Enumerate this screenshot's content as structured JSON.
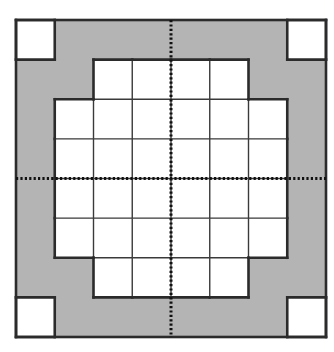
{
  "diagram": {
    "title": "",
    "grid": {
      "rows": 8,
      "cols": 8,
      "origin_x": 16,
      "origin_y": 20,
      "width": 310,
      "height": 317
    },
    "colors": {
      "background": "#ffffff",
      "shaded": "#b4b4b4",
      "cell_fill": "#ffffff",
      "grid_line": "#3a3a3a",
      "outline": "#2b2b2b",
      "dotted_line": "#111111"
    },
    "layout_map": [
      "WGGGGGGW",
      "GGWWWWGG",
      "GWWWWWWG",
      "GWWWWWWG",
      "GWWWWWWG",
      "GWWWWWWG",
      "GGWWWWGG",
      "WGGGGGGW"
    ],
    "legend": {
      "W": "white cell",
      "G": "shaded cell"
    },
    "axes": {
      "vertical_dotted_line": "center column divider",
      "horizontal_dotted_line": "center row divider"
    }
  }
}
